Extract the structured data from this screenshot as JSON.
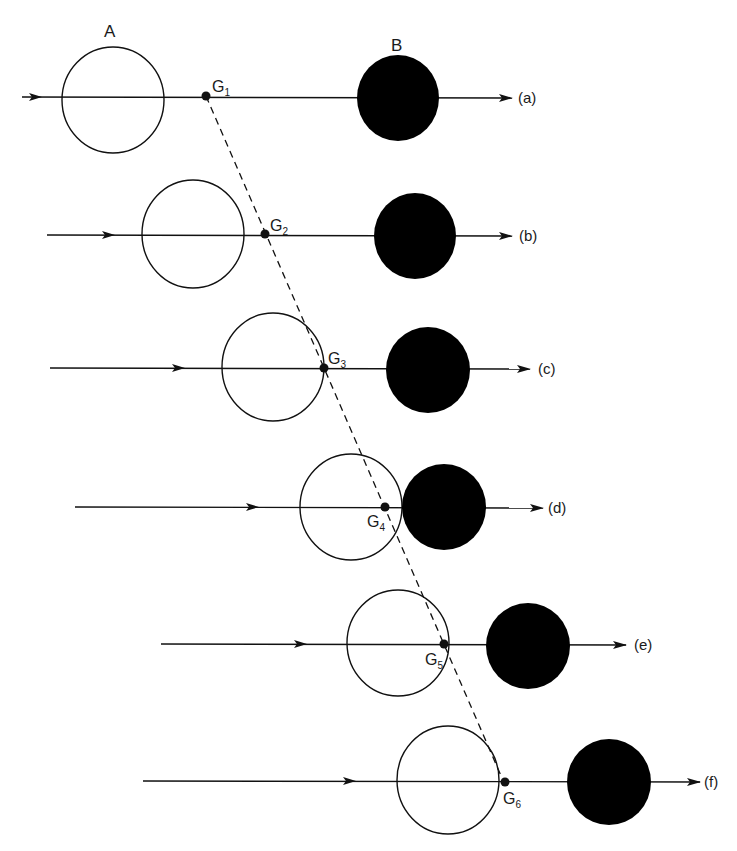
{
  "labels": {
    "body_a": "A",
    "body_b": "B"
  },
  "colors": {
    "ink": "#111111",
    "background": "#ffffff",
    "body_b_fill": "#000000"
  },
  "rows": [
    {
      "id": "a",
      "tag": "(a)",
      "center_of_mass": "G",
      "sub": "1",
      "y": 97,
      "line_x1": 22,
      "line_x2": 512,
      "tail_arrow_x": 40,
      "a": {
        "cx": 113,
        "cy": 100,
        "rx": 51,
        "ry": 53
      },
      "b": {
        "cx": 398,
        "cy": 98,
        "rx": 41,
        "ry": 43
      },
      "g": {
        "x": 206,
        "y": 96
      },
      "g_label": {
        "x": 212,
        "y": 92,
        "anchor": "start"
      },
      "tag_x": 518
    },
    {
      "id": "b",
      "tag": "(b)",
      "center_of_mass": "G",
      "sub": "2",
      "y": 235,
      "line_x1": 47,
      "line_x2": 512,
      "tail_arrow_x": 113,
      "a": {
        "cx": 193,
        "cy": 234,
        "rx": 51,
        "ry": 54
      },
      "b": {
        "cx": 415,
        "cy": 236,
        "rx": 41,
        "ry": 43
      },
      "g": {
        "x": 265,
        "y": 234
      },
      "g_label": {
        "x": 270,
        "y": 231,
        "anchor": "start"
      },
      "tag_x": 519
    },
    {
      "id": "c",
      "tag": "(c)",
      "center_of_mass": "G",
      "sub": "3",
      "y": 368,
      "line_x1": 50,
      "line_x2": 530,
      "tail_arrow_x": 183,
      "a": {
        "cx": 273,
        "cy": 367,
        "rx": 51,
        "ry": 54
      },
      "b": {
        "cx": 428,
        "cy": 370,
        "rx": 42,
        "ry": 43
      },
      "g": {
        "x": 324,
        "y": 368
      },
      "g_label": {
        "x": 328,
        "y": 364,
        "anchor": "start"
      },
      "tag_x": 538
    },
    {
      "id": "d",
      "tag": "(d)",
      "center_of_mass": "G",
      "sub": "4",
      "y": 507,
      "line_x1": 75,
      "line_x2": 543,
      "tail_arrow_x": 257,
      "a": {
        "cx": 351,
        "cy": 507,
        "rx": 51,
        "ry": 53
      },
      "b": {
        "cx": 444,
        "cy": 507,
        "rx": 42,
        "ry": 43
      },
      "g": {
        "x": 385,
        "y": 507
      },
      "g_label": {
        "x": 367,
        "y": 527,
        "anchor": "start"
      },
      "tag_x": 548
    },
    {
      "id": "e",
      "tag": "(e)",
      "center_of_mass": "G",
      "sub": "5",
      "y": 644,
      "line_x1": 161,
      "line_x2": 626,
      "tail_arrow_x": 305,
      "a": {
        "cx": 398,
        "cy": 643,
        "rx": 51,
        "ry": 53
      },
      "b": {
        "cx": 528,
        "cy": 646,
        "rx": 42,
        "ry": 43
      },
      "g": {
        "x": 444,
        "y": 644
      },
      "g_label": {
        "x": 425,
        "y": 665,
        "anchor": "start"
      },
      "tag_x": 634
    },
    {
      "id": "f",
      "tag": "(f)",
      "center_of_mass": "G",
      "sub": "6",
      "y": 781,
      "line_x1": 143,
      "line_x2": 700,
      "tail_arrow_x": 354,
      "a": {
        "cx": 448,
        "cy": 780,
        "rx": 51,
        "ry": 54
      },
      "b": {
        "cx": 609,
        "cy": 782,
        "rx": 42,
        "ry": 43
      },
      "g": {
        "x": 505,
        "y": 782
      },
      "g_label": {
        "x": 503,
        "y": 804,
        "anchor": "start"
      },
      "tag_x": 704
    }
  ],
  "trajectory": {
    "x1": 206,
    "y1": 96,
    "x2": 502,
    "y2": 778,
    "style": "dashed"
  },
  "label_positions": {
    "body_a": {
      "x": 104,
      "y": 37
    },
    "body_b": {
      "x": 391,
      "y": 51
    }
  }
}
